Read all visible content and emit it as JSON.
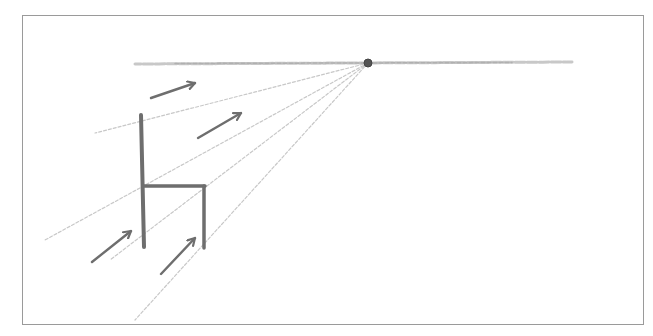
{
  "colors": {
    "background": "#ffffff",
    "frame": "#9a9a9a",
    "pencil_dark": "#6e6e6e",
    "pencil_light": "#c8c8c8",
    "vanishing_point": "#555555"
  },
  "frame": {
    "x": 22,
    "y": 15,
    "width": 622,
    "height": 310
  },
  "horizon_line": {
    "x1": 135,
    "y1": 64,
    "x2": 572,
    "y2": 62
  },
  "vanishing_point": {
    "cx": 368,
    "cy": 63,
    "r": 4
  },
  "guide_lines": [
    {
      "name": "guide-top-back",
      "x1": 368,
      "y1": 63,
      "x2": 95,
      "y2": 133
    },
    {
      "name": "guide-seat-front",
      "x1": 368,
      "y1": 63,
      "x2": 45,
      "y2": 240
    },
    {
      "name": "guide-seat-back",
      "x1": 368,
      "y1": 63,
      "x2": 110,
      "y2": 260
    },
    {
      "name": "guide-right-leg",
      "x1": 368,
      "y1": 63,
      "x2": 135,
      "y2": 320
    }
  ],
  "chair": {
    "back_and_left_leg": {
      "x1": 141,
      "y1": 115,
      "x2": 144,
      "y2": 247
    },
    "seat": {
      "x1": 143,
      "y1": 186,
      "x2": 205,
      "y2": 186
    },
    "right_leg": {
      "x1": 204,
      "y1": 186,
      "x2": 204,
      "y2": 248
    }
  },
  "arrows": [
    {
      "name": "arrow-upper-left",
      "x1": 151,
      "y1": 98,
      "x2": 195,
      "y2": 83
    },
    {
      "name": "arrow-upper-right",
      "x1": 198,
      "y1": 138,
      "x2": 241,
      "y2": 113
    },
    {
      "name": "arrow-lower-left",
      "x1": 92,
      "y1": 262,
      "x2": 131,
      "y2": 231
    },
    {
      "name": "arrow-lower-right",
      "x1": 161,
      "y1": 274,
      "x2": 195,
      "y2": 238
    }
  ]
}
